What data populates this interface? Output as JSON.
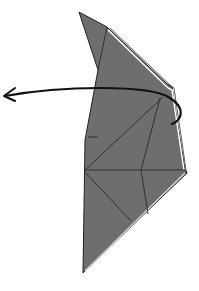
{
  "diagram": {
    "type": "origami-fold-step",
    "instruction": "fold over behind / turn to the left",
    "colors": {
      "paper": "#6e6e6e",
      "paper_edge_highlight": "#ffffff",
      "crease": "#2a2a2a",
      "arrow": "#111111",
      "background": "#ffffff"
    },
    "shape": {
      "outline": [
        [
          79,
          12
        ],
        [
          107,
          27
        ],
        [
          167,
          84
        ],
        [
          172,
          87
        ],
        [
          185,
          170
        ],
        [
          187,
          173
        ],
        [
          83,
          273
        ],
        [
          85,
          140
        ],
        [
          98,
          70
        ]
      ],
      "highlight_edge": [
        [
          107,
          27
        ],
        [
          170,
          86
        ],
        [
          183,
          170
        ]
      ]
    },
    "creases": [
      [
        [
          107,
          27
        ],
        [
          98,
          70
        ]
      ],
      [
        [
          85,
          170
        ],
        [
          185,
          170
        ]
      ],
      [
        [
          85,
          170
        ],
        [
          130,
          220
        ]
      ],
      [
        [
          85,
          170
        ],
        [
          165,
          100
        ]
      ],
      [
        [
          140,
          170
        ],
        [
          160,
          100
        ]
      ],
      [
        [
          140,
          170
        ],
        [
          148,
          215
        ]
      ],
      [
        [
          88,
          138
        ],
        [
          98,
          138
        ]
      ]
    ],
    "arrow": {
      "path": "M5,96 C60,86 150,84 170,98 C186,108 182,120 172,124",
      "head_at": [
        5,
        96
      ],
      "direction": "left"
    }
  }
}
